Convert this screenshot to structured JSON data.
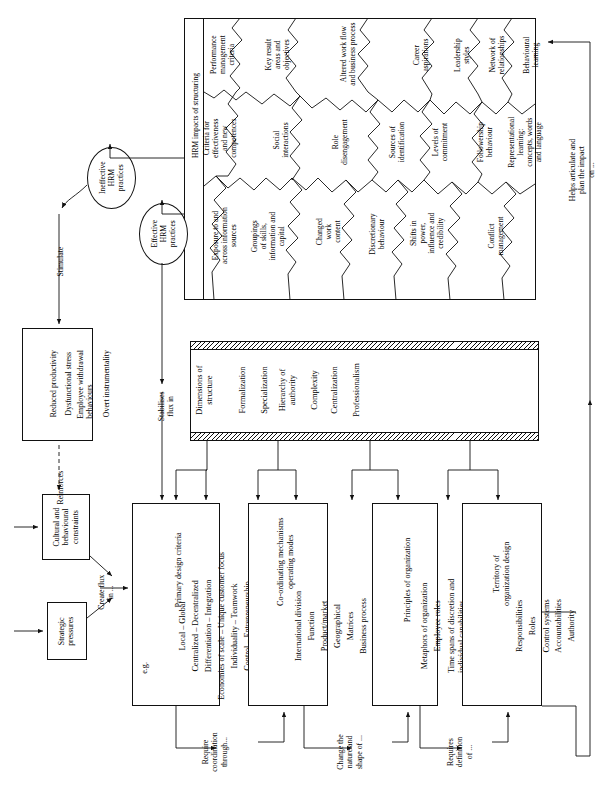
{
  "figure": {
    "jigsaw_heading": "HRM impacts of structuring"
  },
  "jigsaw_pieces": [
    {
      "id": "performance-management-criteria",
      "label": "Performance\nmanagement\ncriteria"
    },
    {
      "id": "key-result-areas-and-objectives",
      "label": "Key result\nareas and\nobjectives"
    },
    {
      "id": "altered-work-flow-and-business-process",
      "label": "Altered work flow\nand business process"
    },
    {
      "id": "career-aspirations",
      "label": "Career\naspirations"
    },
    {
      "id": "leadership-styles",
      "label": "Leadership\nstyles"
    },
    {
      "id": "network-of-relationships",
      "label": "Network of\nrelationships"
    },
    {
      "id": "behavioural-learning",
      "label": "Behavioural\nlearning"
    },
    {
      "id": "criteria-for-effectiveness-and-new-competences",
      "label": "Criteria for\neffectiveness\nand new\ncompetences"
    },
    {
      "id": "social-interactions",
      "label": "Social\ninteractions"
    },
    {
      "id": "role-disengagement",
      "label": "Role\ndisengagement"
    },
    {
      "id": "sources-of-identification",
      "label": "Sources of\nidentification"
    },
    {
      "id": "levels-of-commitment",
      "label": "Levels of\ncommitment"
    },
    {
      "id": "followership-behaviour",
      "label": "Followership\nbehaviour"
    },
    {
      "id": "representational-learning",
      "label": "Representational\nlearning:\nconcepts, words\nand language"
    },
    {
      "id": "exposure-to-and-across-information-sources",
      "label": "Exposure to and\nacross information\nsources"
    },
    {
      "id": "groupings-of-skills-information-and-capital",
      "label": "Groupings\nof skills,\ninformation and\ncapital"
    },
    {
      "id": "changed-work-content",
      "label": "Changed\nwork\ncontent"
    },
    {
      "id": "discretionary-behaviour",
      "label": "Discretionary\nbehaviour"
    },
    {
      "id": "shifts-in-power-influence-and-credibility",
      "label": "Shifts in\npower,\ninfluence and\ncredibility"
    },
    {
      "id": "conflict-management",
      "label": "Conflict\nmanagement"
    }
  ],
  "nodes": {
    "ineffective_hrm": "Ineffective\nHRM\npractices",
    "effective_hrm": "Effective\nHRM\npractices",
    "outcomes": {
      "items": [
        "Reduced productivity",
        "Dysfunctional stress",
        "Employee withdrawal\nbehaviours",
        "Overt instrumentality"
      ]
    },
    "cultural_constraints": "Cultural and\nbehavioural\nconstraints",
    "strategic_pressures": "Strategic\npressures"
  },
  "structure_bar": {
    "title": "Dimensions of\nstructure",
    "items": [
      "Formalization",
      "Specialization",
      "Hierarchy of\nauthority",
      "Complexity",
      "Centralization",
      "Professionalism"
    ]
  },
  "columns": [
    {
      "id": "primary-design-criteria",
      "title": "Primary design criteria",
      "eg": "e.g.",
      "items": [
        "Local  –  Global",
        "Centralized  –  Decentralized",
        "Differentiation  –  Integration",
        "Economies of scale  –  Unique customer focus",
        "Individuality  –  Teamwork",
        "Control  –  Entrepreneurship"
      ]
    },
    {
      "id": "co-ordinating-mechanisms",
      "title": "Co-ordinating mechanisms\noperating modes",
      "items": [
        "International division",
        "Function",
        "Product/market",
        "Geographical",
        "Matrices",
        "Business process"
      ]
    },
    {
      "id": "principles-of-organization",
      "title": "Principles of organization",
      "items": [
        "Metaphors of organization",
        "Employee roles",
        "Time spans of discretion and\nindividual capabilities"
      ]
    },
    {
      "id": "territory-of-organization-design",
      "title": "Territory of\norganization design",
      "items": [
        "Responsibilities",
        "Roles",
        "Control systems",
        "Accountabilities",
        "Authority"
      ]
    }
  ],
  "edge_labels": {
    "stimulate": "Stimulate",
    "reinforces": "Reinforces",
    "create_flux_in": "Create flux\nin ...",
    "stabilises_flux_in": "Stabilises\nflux in",
    "require_coordination_through": "Require\ncoordination\nthrough...",
    "change_the_nature_and_shape_of": "Change the\nnature and\nshape of ...",
    "requires_definition_of": "Requires\ndefinition\nof ...",
    "helps_articulate": "Helps articulate and\nplan the impact\non ..."
  }
}
